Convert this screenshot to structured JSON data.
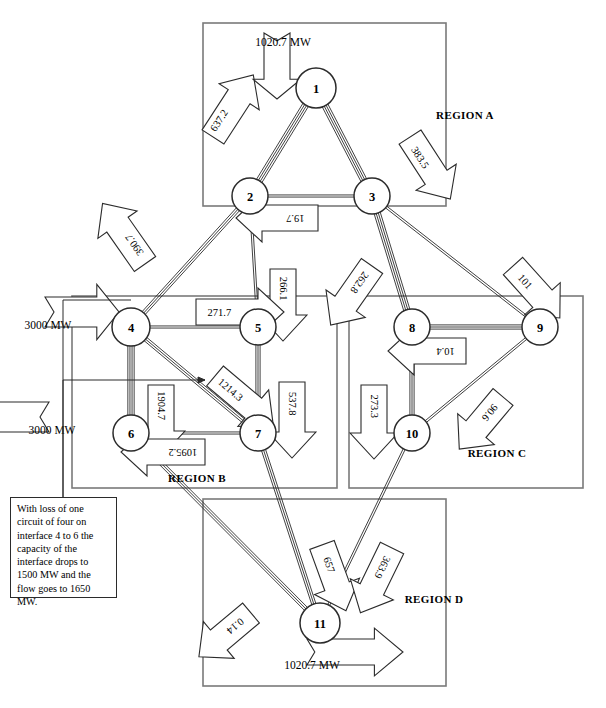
{
  "diagram": {
    "units": "MW",
    "caption": ""
  },
  "regions": [
    {
      "id": "A",
      "label": "REGION A",
      "x": 203,
      "y": 23,
      "w": 243,
      "h": 183,
      "label_x": 465,
      "label_y": 119
    },
    {
      "id": "B",
      "label": "REGION B",
      "x": 72,
      "y": 296,
      "w": 265,
      "h": 192,
      "label_x": 197,
      "label_y": 482
    },
    {
      "id": "C",
      "label": "REGION C",
      "x": 349,
      "y": 296,
      "w": 234,
      "h": 192,
      "label_x": 497,
      "label_y": 457
    },
    {
      "id": "D",
      "label": "REGION D",
      "x": 203,
      "y": 499,
      "w": 243,
      "h": 187,
      "label_x": 434,
      "label_y": 603
    }
  ],
  "nodes": [
    {
      "id": "1",
      "label": "1",
      "x": 316,
      "y": 88,
      "r": 20
    },
    {
      "id": "2",
      "label": "2",
      "x": 250,
      "y": 196,
      "r": 18
    },
    {
      "id": "3",
      "label": "3",
      "x": 372,
      "y": 196,
      "r": 18
    },
    {
      "id": "4",
      "label": "4",
      "x": 131,
      "y": 327,
      "r": 19
    },
    {
      "id": "5",
      "label": "5",
      "x": 258,
      "y": 327,
      "r": 18
    },
    {
      "id": "6",
      "label": "6",
      "x": 131,
      "y": 433,
      "r": 18
    },
    {
      "id": "7",
      "label": "7",
      "x": 258,
      "y": 433,
      "r": 18
    },
    {
      "id": "8",
      "label": "8",
      "x": 412,
      "y": 327,
      "r": 18
    },
    {
      "id": "9",
      "label": "9",
      "x": 540,
      "y": 327,
      "r": 18
    },
    {
      "id": "10",
      "label": "10",
      "x": 412,
      "y": 433,
      "r": 18
    },
    {
      "id": "11",
      "label": "11",
      "x": 320,
      "y": 623,
      "r": 20
    }
  ],
  "branches": [
    {
      "from": "1",
      "to": "2",
      "circuits": 4
    },
    {
      "from": "1",
      "to": "3",
      "circuits": 4
    },
    {
      "from": "2",
      "to": "3",
      "circuits": 2
    },
    {
      "from": "2",
      "to": "4",
      "circuits": 3
    },
    {
      "from": "2",
      "to": "5",
      "circuits": 2
    },
    {
      "from": "3",
      "to": "8",
      "circuits": 4
    },
    {
      "from": "3",
      "to": "9",
      "circuits": 2
    },
    {
      "from": "4",
      "to": "5",
      "circuits": 2
    },
    {
      "from": "4",
      "to": "6",
      "circuits": 4
    },
    {
      "from": "4",
      "to": "7",
      "circuits": 3
    },
    {
      "from": "5",
      "to": "7",
      "circuits": 3
    },
    {
      "from": "6",
      "to": "7",
      "circuits": 2
    },
    {
      "from": "8",
      "to": "9",
      "circuits": 3
    },
    {
      "from": "8",
      "to": "10",
      "circuits": 3
    },
    {
      "from": "9",
      "to": "10",
      "circuits": 2
    },
    {
      "from": "6",
      "to": "11",
      "circuits": 3
    },
    {
      "from": "7",
      "to": "11",
      "circuits": 3
    },
    {
      "from": "10",
      "to": "11",
      "circuits": 2
    }
  ],
  "flows": [
    {
      "id": "f-1-2",
      "from": "1",
      "to": "2",
      "value": "637.2",
      "rotation": -57,
      "lx": 213,
      "ly": 137,
      "tx": 207,
      "ty": 139,
      "len": 74,
      "th": 26
    },
    {
      "id": "f-1-3",
      "from": "1",
      "to": "3",
      "value": "383.5",
      "rotation": 57,
      "lx": 410,
      "ly": 137,
      "tx": 408,
      "ty": 139,
      "len": 74,
      "th": 26
    },
    {
      "id": "f-3-2",
      "from": "3",
      "to": "2",
      "value": "19.7",
      "rotation": 180,
      "lx": 318,
      "ly": 218,
      "tx": 320,
      "ty": 218,
      "len": 82,
      "th": 26
    },
    {
      "id": "f-2-4",
      "from": "2",
      "to": "4",
      "value": "390.7",
      "rotation": -125,
      "lx": 145,
      "ly": 264,
      "tx": 147,
      "ty": 263,
      "len": 74,
      "th": 26
    },
    {
      "id": "f-2-5",
      "from": "2",
      "to": "5",
      "value": "266.1",
      "rotation": 90,
      "lx": 283,
      "ly": 269,
      "tx": 283,
      "ty": 267,
      "len": 72,
      "th": 26
    },
    {
      "id": "f-3-8",
      "from": "3",
      "to": "8",
      "value": "262.8",
      "rotation": 125,
      "lx": 372,
      "ly": 266,
      "tx": 372,
      "ty": 265,
      "len": 72,
      "th": 26
    },
    {
      "id": "f-3-9",
      "from": "3",
      "to": "9",
      "value": "101",
      "rotation": 48,
      "lx": 513,
      "ly": 266,
      "tx": 511,
      "ty": 266,
      "len": 70,
      "th": 26
    },
    {
      "id": "f-4-5",
      "from": "4",
      "to": "5",
      "value": "271.7",
      "rotation": 0,
      "lx": 196,
      "ly": 312,
      "tx": 193,
      "ty": 312,
      "len": 88,
      "th": 26
    },
    {
      "id": "f-4-7",
      "from": "4",
      "to": "7",
      "value": "1214.3",
      "rotation": 40,
      "lx": 215,
      "ly": 376,
      "tx": 213,
      "ty": 375,
      "len": 76,
      "th": 26
    },
    {
      "id": "f-4-6",
      "from": "4",
      "to": "6",
      "value": "1904.7",
      "rotation": 90,
      "lx": 161,
      "ly": 385,
      "tx": 161,
      "ty": 384,
      "len": 72,
      "th": 26
    },
    {
      "id": "f-5-7",
      "from": "5",
      "to": "7",
      "value": "537.8",
      "rotation": 90,
      "lx": 292,
      "ly": 382,
      "tx": 292,
      "ty": 381,
      "len": 76,
      "th": 26
    },
    {
      "id": "f-7-6",
      "from": "7",
      "to": "6",
      "value": "1095.2",
      "rotation": 180,
      "lx": 205,
      "ly": 452,
      "tx": 208,
      "ty": 452,
      "len": 84,
      "th": 26
    },
    {
      "id": "f-9-8",
      "from": "9",
      "to": "8",
      "value": "10.4",
      "rotation": 180,
      "lx": 466,
      "ly": 351,
      "tx": 469,
      "ty": 351,
      "len": 78,
      "th": 26
    },
    {
      "id": "f-8-10",
      "from": "8",
      "to": "10",
      "value": "273.3",
      "rotation": 90,
      "lx": 374,
      "ly": 385,
      "tx": 374,
      "ty": 384,
      "len": 74,
      "th": 26
    },
    {
      "id": "f-9-10",
      "from": "9",
      "to": "10",
      "value": "90.6",
      "rotation": 130,
      "lx": 503,
      "ly": 397,
      "tx": 503,
      "ty": 397,
      "len": 68,
      "th": 26
    },
    {
      "id": "f-7-11",
      "from": "7",
      "to": "11",
      "value": "657",
      "rotation": 70,
      "lx": 322,
      "ly": 545,
      "tx": 322,
      "ty": 545,
      "len": 70,
      "th": 26
    },
    {
      "id": "f-10-11",
      "from": "10",
      "to": "11",
      "value": "363.9",
      "rotation": 116,
      "lx": 392,
      "ly": 548,
      "tx": 392,
      "ty": 548,
      "len": 72,
      "th": 26
    },
    {
      "id": "f-6-11",
      "from": "6",
      "to": "11",
      "value": "0.14",
      "rotation": 140,
      "lx": 251,
      "ly": 613,
      "tx": 251,
      "ty": 613,
      "len": 68,
      "th": 26
    }
  ],
  "boundary_flows": [
    {
      "id": "inject-1",
      "label": "1020.7 MW",
      "direction": "down",
      "lx": 277,
      "ly": 33,
      "tx": 283,
      "ty": 42,
      "len": 66,
      "th": 26,
      "node": "1"
    },
    {
      "id": "import-4",
      "label": "3000 MW",
      "direction": "right",
      "lx": 45,
      "ly": 312,
      "tx": 48,
      "ty": 325,
      "len": 74,
      "th": 30,
      "node": "4"
    },
    {
      "id": "export-6",
      "label": "3000 MW",
      "direction": "left",
      "lx": 49,
      "ly": 417,
      "tx": 52,
      "ty": 430,
      "len": 74,
      "th": 30,
      "node": "6"
    },
    {
      "id": "export-11",
      "label": "1020.7 MW",
      "direction": "right",
      "lx": 307,
      "ly": 652,
      "tx": 312,
      "ty": 665,
      "len": 96,
      "th": 26,
      "node": "11"
    }
  ],
  "note": {
    "id": "contingency-note",
    "text": "With loss of one circuit of four on interface 4 to 6 the capacity of the interface drops to 1500 MW and the flow goes to 1650 MW.",
    "x": 10,
    "y": 497,
    "w": 107,
    "h": 101,
    "leader_from_x": 63,
    "leader_from_y": 497,
    "leader_to_x": 205,
    "leader_to_y": 380
  }
}
